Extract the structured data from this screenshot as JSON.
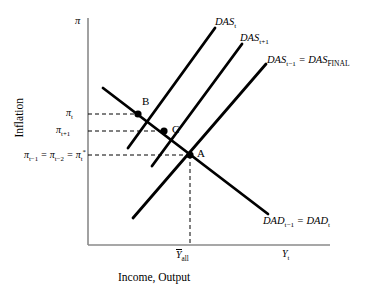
{
  "figure": {
    "type": "economics-diagram"
  },
  "axes": {
    "y_title": "Inflation",
    "y_symbol": "π",
    "x_title": "Income, Output",
    "x_symbol_label": "Y",
    "x_symbol_sub": "t",
    "origin": {
      "x": 88,
      "y": 245
    },
    "x_axis_end": {
      "x": 330,
      "y": 245
    },
    "y_axis_top": {
      "x": 88,
      "y": 18
    }
  },
  "curves": [
    {
      "name": "DAS_t",
      "label_main": "DAS",
      "label_sub": "t",
      "kind": "supply",
      "x1": 128,
      "y1": 148,
      "x2": 215,
      "y2": 28
    },
    {
      "name": "DAS_t+1",
      "label_main": "DAS",
      "label_sub": "t+1",
      "kind": "supply",
      "x1": 152,
      "y1": 166,
      "x2": 242,
      "y2": 44
    },
    {
      "name": "DAS_t-1 = DAS_FINAL",
      "label_main": "DAS",
      "label_sub": "t−1",
      "label_eq": " = ",
      "label_main2": "DAS",
      "label_sub2": "FINAL",
      "kind": "supply",
      "x1": 133,
      "y1": 218,
      "x2": 266,
      "y2": 64
    },
    {
      "name": "DAD_t-1 = DAD_t",
      "label_main": "DAD",
      "label_sub": "t−1",
      "label_eq": " = ",
      "label_main2": "DAD",
      "label_sub2": "t",
      "kind": "demand",
      "x1": 103,
      "y1": 88,
      "x2": 268,
      "y2": 214
    }
  ],
  "points": [
    {
      "id": "A",
      "label": "A",
      "x": 190,
      "y": 155
    },
    {
      "id": "B",
      "label": "B",
      "x": 138,
      "y": 114
    },
    {
      "id": "C",
      "label": "C",
      "x": 164,
      "y": 131
    }
  ],
  "y_ticks": [
    {
      "id": "pi_t",
      "main": "π",
      "sub": "t",
      "y": 114
    },
    {
      "id": "pi_t1",
      "main": "π",
      "sub": "t+1",
      "y": 131
    },
    {
      "id": "pi_star",
      "text_parts": [
        "π",
        "t−1",
        " = ",
        "π",
        "t−2",
        " = ",
        "π",
        "t",
        "*"
      ],
      "y": 155
    }
  ],
  "x_ticks": [
    {
      "id": "y_all",
      "main": "Y",
      "sub": "all",
      "overbar": true,
      "x": 190
    },
    {
      "id": "y_t",
      "main": "Y",
      "sub": "t",
      "overbar": false,
      "x": 290
    }
  ],
  "colors": {
    "curve": "#000000",
    "axis": "#808080",
    "dashed": "#000000",
    "background": "#ffffff"
  }
}
